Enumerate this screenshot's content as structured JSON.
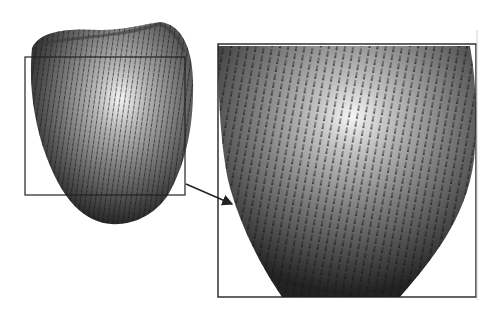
{
  "figure": {
    "left_view": {
      "label": "full-ventricle-view",
      "highlight_box": {
        "x": 25,
        "y": 57,
        "w": 160,
        "h": 138
      }
    },
    "connector_arrow": {
      "from": [
        186,
        184
      ],
      "to": [
        233,
        205
      ]
    },
    "right_view": {
      "label": "magnified-view",
      "frame": {
        "x": 218,
        "y": 44,
        "w": 258,
        "h": 253
      }
    },
    "colors": {
      "surface_dark": "#2a2a2a",
      "surface_mid": "#8a8a8a",
      "surface_highlight": "#f2f2f2",
      "vector_glyph": "#1a1a1a",
      "frame_stroke": "#222222",
      "background": "#ffffff"
    }
  }
}
